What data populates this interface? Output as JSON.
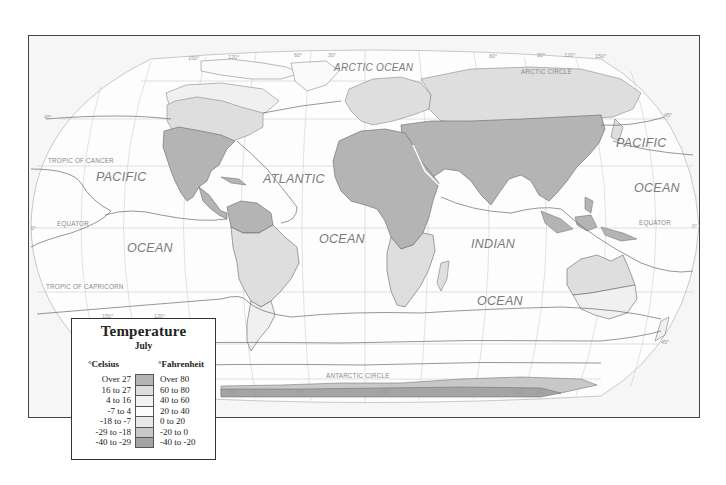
{
  "map": {
    "title": "Temperature",
    "subtitle": "July",
    "projection_labels": {
      "oceans": [
        {
          "name": "ARCTIC OCEAN",
          "x": 332,
          "y": 72
        },
        {
          "name": "PACIFIC",
          "x": 94,
          "y": 179
        },
        {
          "name": "OCEAN",
          "x": 127,
          "y": 250
        },
        {
          "name": "ATLANTIC",
          "x": 262,
          "y": 181
        },
        {
          "name": "OCEAN",
          "x": 318,
          "y": 241
        },
        {
          "name": "INDIAN",
          "x": 469,
          "y": 246
        },
        {
          "name": "OCEAN",
          "x": 476,
          "y": 303
        },
        {
          "name": "PACIFIC",
          "x": 615,
          "y": 145
        },
        {
          "name": "OCEAN",
          "x": 633,
          "y": 190
        }
      ],
      "reference_lines": [
        {
          "name": "ARCTIC CIRCLE",
          "x": 558,
          "y": 73
        },
        {
          "name": "TROPIC OF CANCER",
          "x": 47,
          "y": 162
        },
        {
          "name": "EQUATOR",
          "x": 56,
          "y": 226
        },
        {
          "name": "EQUATOR",
          "x": 638,
          "y": 222
        },
        {
          "name": "TROPIC OF CAPRICORN",
          "x": 45,
          "y": 288
        },
        {
          "name": "ANTARCTIC CIRCLE",
          "x": 325,
          "y": 378
        }
      ],
      "degree_marks": [
        {
          "text": "150°",
          "x": 187,
          "y": 59
        },
        {
          "text": "120°",
          "x": 227,
          "y": 58
        },
        {
          "text": "60°",
          "x": 293,
          "y": 56
        },
        {
          "text": "30°",
          "x": 327,
          "y": 56
        },
        {
          "text": "60°",
          "x": 488,
          "y": 57
        },
        {
          "text": "90°",
          "x": 536,
          "y": 56
        },
        {
          "text": "120°",
          "x": 563,
          "y": 56
        },
        {
          "text": "150°",
          "x": 594,
          "y": 57
        },
        {
          "text": "45°",
          "x": 43,
          "y": 118
        },
        {
          "text": "45°",
          "x": 663,
          "y": 116
        },
        {
          "text": "0°",
          "x": 30,
          "y": 229
        },
        {
          "text": "0°",
          "x": 691,
          "y": 227
        },
        {
          "text": "150°",
          "x": 101,
          "y": 317
        },
        {
          "text": "120°",
          "x": 153,
          "y": 317
        },
        {
          "text": "45°",
          "x": 660,
          "y": 343
        },
        {
          "text": "150°",
          "x": 226,
          "y": 397
        },
        {
          "text": "60°",
          "x": 295,
          "y": 397
        },
        {
          "text": "30°",
          "x": 380,
          "y": 397
        },
        {
          "text": "120°",
          "x": 512,
          "y": 397
        },
        {
          "text": "150°",
          "x": 534,
          "y": 397
        }
      ]
    }
  },
  "legend": {
    "title": "Temperature",
    "subtitle": "July",
    "celsius_header": "°Celsius",
    "fahrenheit_header": "°Fahrenheit",
    "entries": [
      {
        "celsius": "Over 27",
        "fahrenheit": "Over 80",
        "color": "#b4b4b4"
      },
      {
        "celsius": "16 to 27",
        "fahrenheit": "60 to 80",
        "color": "#dedede"
      },
      {
        "celsius": "4 to 16",
        "fahrenheit": "40 to 60",
        "color": "#f2f2f2"
      },
      {
        "celsius": "-7 to 4",
        "fahrenheit": "20 to 40",
        "color": "#fbfbfb"
      },
      {
        "celsius": "-18 to -7",
        "fahrenheit": "0 to 20",
        "color": "#e8e8e8"
      },
      {
        "celsius": "-29 to -18",
        "fahrenheit": "-20 to 0",
        "color": "#c8c8c8"
      },
      {
        "celsius": "-40 to -29",
        "fahrenheit": "-40 to -20",
        "color": "#a4a4a4"
      }
    ]
  },
  "colors": {
    "frame_border": "#444444",
    "frame_bg": "#f6f6f6",
    "ocean": "#fdfdfd",
    "land_hot": "#b4b4b4",
    "land_warm": "#dedede",
    "land_mild": "#eeeeee",
    "antarctica_cold": "#a4a4a4",
    "antarctica_mid": "#c8c8c8",
    "graticule": "#c8c8c8",
    "isotherm": "#666666"
  }
}
